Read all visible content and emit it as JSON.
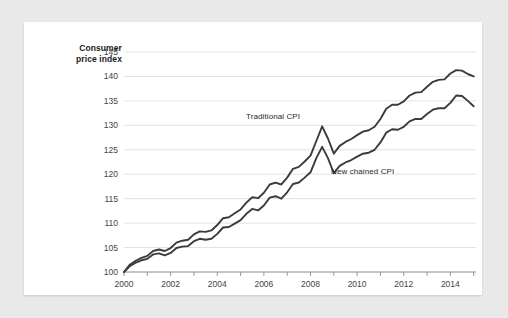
{
  "card": {
    "background": "#ffffff",
    "page_background": "#e9e9e9"
  },
  "axis_title": {
    "line1": "Consumer",
    "line2": "price index"
  },
  "chart_data": {
    "type": "line",
    "title": "",
    "subtitle": "",
    "xlabel": "",
    "ylabel": "Consumer price index",
    "xlim": [
      2000,
      2015.1
    ],
    "ylim": [
      100,
      145
    ],
    "yticks": [
      100,
      105,
      110,
      115,
      120,
      125,
      130,
      135,
      140,
      145
    ],
    "xticks": [
      2000,
      2002,
      2004,
      2006,
      2008,
      2010,
      2012,
      2014
    ],
    "xticks_minor": [
      2001,
      2003,
      2005,
      2007,
      2009,
      2011,
      2013,
      2015
    ],
    "grid": "horizontal",
    "legend_position": "inline-annotations",
    "line_color": "#3b3b3b",
    "grid_color": "#e2e2e2",
    "axis_color": "#9a9a9a",
    "annotations": [
      {
        "text": "Traditional CPI",
        "x": 2006.6,
        "y": 131.6
      },
      {
        "text": "New chained CPI",
        "x": 2009.6,
        "y": 121.5
      }
    ],
    "series": [
      {
        "name": "Traditional CPI",
        "color": "#3b3b3b",
        "x": [
          2000.0,
          2000.25,
          2000.5,
          2000.75,
          2001.0,
          2001.25,
          2001.5,
          2001.75,
          2002.0,
          2002.25,
          2002.5,
          2002.75,
          2003.0,
          2003.25,
          2003.5,
          2003.75,
          2004.0,
          2004.25,
          2004.5,
          2004.75,
          2005.0,
          2005.25,
          2005.5,
          2005.75,
          2006.0,
          2006.25,
          2006.5,
          2006.75,
          2007.0,
          2007.25,
          2007.5,
          2007.75,
          2008.0,
          2008.25,
          2008.5,
          2008.75,
          2009.0,
          2009.25,
          2009.5,
          2009.75,
          2010.0,
          2010.25,
          2010.5,
          2010.75,
          2011.0,
          2011.25,
          2011.5,
          2011.75,
          2012.0,
          2012.25,
          2012.5,
          2012.75,
          2013.0,
          2013.25,
          2013.5,
          2013.75,
          2014.0,
          2014.25,
          2014.5,
          2014.75,
          2015.0
        ],
        "values": [
          100.0,
          101.2,
          101.9,
          102.4,
          102.7,
          103.6,
          103.8,
          103.4,
          103.9,
          104.9,
          105.2,
          105.3,
          106.3,
          106.8,
          106.6,
          106.8,
          107.8,
          109.1,
          109.2,
          109.9,
          110.6,
          111.9,
          112.9,
          112.6,
          113.6,
          115.2,
          115.5,
          115.0,
          116.3,
          118.0,
          118.3,
          119.3,
          120.4,
          123.3,
          125.6,
          123.3,
          120.2,
          121.7,
          122.4,
          122.9,
          123.6,
          124.2,
          124.4,
          125.0,
          126.5,
          128.5,
          129.2,
          129.1,
          129.7,
          130.8,
          131.3,
          131.3,
          132.3,
          133.2,
          133.5,
          133.5,
          134.6,
          136.1,
          136.0,
          135.0,
          133.9
        ]
      },
      {
        "name": "New chained CPI",
        "color": "#3b3b3b",
        "x": [
          2000.0,
          2000.25,
          2000.5,
          2000.75,
          2001.0,
          2001.25,
          2001.5,
          2001.75,
          2002.0,
          2002.25,
          2002.5,
          2002.75,
          2003.0,
          2003.25,
          2003.5,
          2003.75,
          2004.0,
          2004.25,
          2004.5,
          2004.75,
          2005.0,
          2005.25,
          2005.5,
          2005.75,
          2006.0,
          2006.25,
          2006.5,
          2006.75,
          2007.0,
          2007.25,
          2007.5,
          2007.75,
          2008.0,
          2008.25,
          2008.5,
          2008.75,
          2009.0,
          2009.25,
          2009.5,
          2009.75,
          2010.0,
          2010.25,
          2010.5,
          2010.75,
          2011.0,
          2011.25,
          2011.5,
          2011.75,
          2012.0,
          2012.25,
          2012.5,
          2012.75,
          2013.0,
          2013.25,
          2013.5,
          2013.75,
          2014.0,
          2014.25,
          2014.5,
          2014.75,
          2015.0
        ],
        "values": [
          100.0,
          101.5,
          102.3,
          102.9,
          103.3,
          104.3,
          104.6,
          104.3,
          104.9,
          106.0,
          106.4,
          106.6,
          107.7,
          108.3,
          108.2,
          108.5,
          109.6,
          111.0,
          111.2,
          112.0,
          112.8,
          114.2,
          115.3,
          115.1,
          116.2,
          117.9,
          118.3,
          117.9,
          119.3,
          121.1,
          121.5,
          122.6,
          123.8,
          126.8,
          129.8,
          127.3,
          124.2,
          125.8,
          126.6,
          127.2,
          128.0,
          128.7,
          129.0,
          129.7,
          131.3,
          133.4,
          134.2,
          134.2,
          134.9,
          136.1,
          136.7,
          136.8,
          137.9,
          138.9,
          139.3,
          139.4,
          140.6,
          141.3,
          141.2,
          140.5,
          140.0
        ]
      }
    ]
  }
}
